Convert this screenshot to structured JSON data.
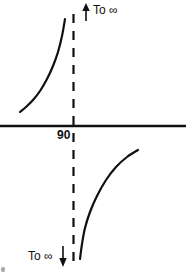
{
  "figure": {
    "type": "math-asymptote-diagram",
    "width": 186,
    "height": 276,
    "background_color": "#ffffff",
    "ink_color": "#101010"
  },
  "labels": {
    "top_infinity": "To ∞",
    "bottom_infinity": "To ∞",
    "asymptote_value": "90"
  },
  "icons": {
    "up_arrow": "arrow-up",
    "down_arrow": "arrow-down"
  },
  "chart_data": {
    "type": "line",
    "title": "",
    "xlabel": "",
    "ylabel": "",
    "grid": false,
    "legend": null,
    "axis": {
      "horizontal_axis_y": 126,
      "horizontal_axis_x_range": [
        0,
        186
      ],
      "horizontal_axis_stroke_width": 2.4
    },
    "asymptote": {
      "label": "90",
      "x": 73.5,
      "style": "dashed",
      "y_range": [
        14,
        264
      ],
      "dash_pattern": "9 8",
      "stroke_width": 2.2
    },
    "annotations": [
      {
        "text": "To ∞",
        "arrow": "up",
        "arrow_x": 86,
        "arrow_y_top": 4,
        "arrow_y_bottom": 21,
        "text_x": 93,
        "text_y": 4
      },
      {
        "text": "To ∞",
        "arrow": "down",
        "arrow_x": 63,
        "arrow_y_top": 246,
        "arrow_y_bottom": 266,
        "text_x": 28,
        "text_y": 250
      }
    ],
    "series": [
      {
        "name": "upper-left-branch",
        "quadrant": "above-axis-left-of-asymptote",
        "approaches": "+infinity",
        "stroke_width": 2.2,
        "points": [
          [
            20,
            112
          ],
          [
            26,
            107
          ],
          [
            33,
            100
          ],
          [
            40,
            91
          ],
          [
            47,
            79
          ],
          [
            53,
            66
          ],
          [
            58,
            52
          ],
          [
            62,
            36
          ],
          [
            65,
            19
          ]
        ]
      },
      {
        "name": "lower-right-branch",
        "quadrant": "below-axis-right-of-asymptote",
        "approaches": "-infinity",
        "stroke_width": 2.2,
        "points": [
          [
            80,
            259
          ],
          [
            82,
            244
          ],
          [
            85,
            228
          ],
          [
            90,
            212
          ],
          [
            97,
            196
          ],
          [
            106,
            180
          ],
          [
            116,
            167
          ],
          [
            127,
            157
          ],
          [
            138,
            150
          ]
        ]
      }
    ]
  }
}
